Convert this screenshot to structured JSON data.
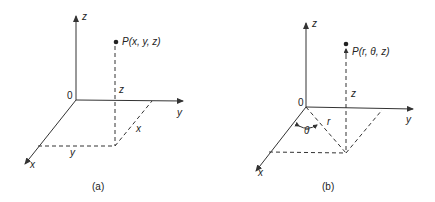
{
  "figures": [
    {
      "id": "a",
      "caption": "(a)",
      "title": "Rectangular coordinates",
      "labels": {
        "z_axis": "z",
        "y_axis": "y",
        "x_axis": "x",
        "origin": "0",
        "point": "P(x, y, z)",
        "height": "z",
        "x_dim": "x",
        "y_dim": "y"
      }
    },
    {
      "id": "b",
      "caption": "(b)",
      "title": "Cylindrical coordinates",
      "labels": {
        "z_axis": "z",
        "y_axis": "y",
        "x_axis": "x",
        "origin": "0",
        "point": "P(r, θ, z)",
        "height": "z",
        "radius": "r",
        "angle": "θ"
      }
    }
  ],
  "colors": {
    "stroke": "#333333",
    "background": "#ffffff"
  }
}
